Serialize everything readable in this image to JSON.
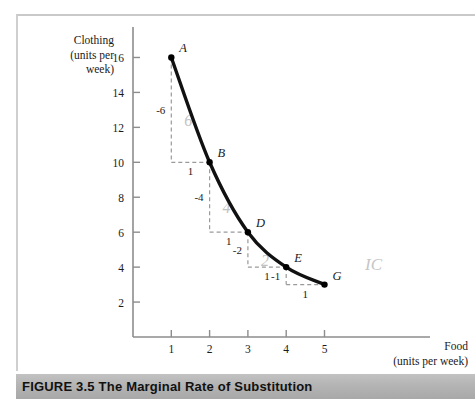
{
  "figure": {
    "caption_number": "FIGURE 3.5",
    "caption_title": "The Marginal Rate of Substitution",
    "caption_full": "FIGURE 3.5  The Marginal Rate of Substitution",
    "curve_label": "IC"
  },
  "axes": {
    "y_title_line1": "Clothing",
    "y_title_line2": "(units per",
    "y_title_line3": "week)",
    "x_title_line1": "Food",
    "x_title_line2": "(units per week)"
  },
  "chart_data": {
    "type": "line",
    "title": "The Marginal Rate of Substitution",
    "xlabel": "Food (units per week)",
    "ylabel": "Clothing (units per week)",
    "xlim": [
      0,
      6
    ],
    "ylim": [
      0,
      17
    ],
    "xticks": [
      1,
      2,
      3,
      4,
      5
    ],
    "yticks": [
      2,
      4,
      6,
      8,
      10,
      12,
      14,
      16
    ],
    "xtick_labels": [
      "1",
      "2",
      "3",
      "4",
      "5"
    ],
    "ytick_labels": [
      "2",
      "4",
      "6",
      "8",
      "10",
      "12",
      "14",
      "16"
    ],
    "grid": false,
    "legend": false,
    "series": [
      {
        "name": "IC",
        "label": "IC",
        "x": [
          1,
          2,
          3,
          4,
          5
        ],
        "y": [
          16,
          10,
          6,
          4,
          3
        ],
        "point_labels": [
          "A",
          "B",
          "D",
          "E",
          "G"
        ]
      }
    ],
    "points": [
      {
        "label": "A",
        "food": 1,
        "clothing": 16
      },
      {
        "label": "B",
        "food": 2,
        "clothing": 10
      },
      {
        "label": "D",
        "food": 3,
        "clothing": 6
      },
      {
        "label": "E",
        "food": 4,
        "clothing": 4
      },
      {
        "label": "G",
        "food": 5,
        "clothing": 3
      }
    ],
    "steps": [
      {
        "from": "A",
        "to": "B",
        "delta_clothing": "-6",
        "delta_food": "1",
        "mrs_handwritten": "6"
      },
      {
        "from": "B",
        "to": "D",
        "delta_clothing": "-4",
        "delta_food": "1",
        "mrs_handwritten": "4"
      },
      {
        "from": "D",
        "to": "E",
        "delta_clothing": "-2",
        "delta_food": "1",
        "mrs_handwritten": "2"
      },
      {
        "from": "E",
        "to": "G",
        "delta_clothing": "-1",
        "delta_food": "1",
        "mrs_handwritten": ""
      }
    ],
    "annotations": [
      "-6",
      "1",
      "6",
      "-4",
      "1",
      "4",
      "-2",
      "1",
      "2",
      "-1",
      "1",
      "IC"
    ]
  },
  "colors": {
    "curve": "#111111",
    "point": "#000000",
    "axis": "#8d8d8d",
    "dashed": "#9a9a9a",
    "text": "#1a1a1a",
    "faded": "#c2c2c2",
    "caption_bar": "#b4b4b4",
    "frame": "#c9c9c9"
  }
}
